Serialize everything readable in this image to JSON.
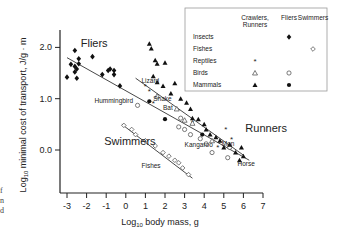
{
  "chart_data": {
    "type": "scatter",
    "title": "",
    "xlabel": "Log10 body mass, g",
    "ylabel": "Log10 minimal cost of transport, J/g·m",
    "xlim": [
      -3.4,
      7
    ],
    "ylim": [
      -0.9,
      2.35
    ],
    "x_ticks": [
      -3,
      -2,
      -1,
      0,
      1,
      2,
      3,
      4,
      5,
      6,
      7
    ],
    "y_ticks": [
      0.0,
      1.0,
      2.0
    ],
    "y_tick_labels": [
      "0.0",
      "1.0",
      "2.0"
    ],
    "grid": false,
    "legend_position": "top-right",
    "legend": {
      "columns": [
        "Crawlers, Runners",
        "Fliers",
        "Swimmers"
      ],
      "rows": [
        {
          "group": "Insects",
          "crawlers_runners": "",
          "fliers": "filled-diamond",
          "swimmers": ""
        },
        {
          "group": "Fishes",
          "crawlers_runners": "",
          "fliers": "",
          "swimmers": "open-diamond"
        },
        {
          "group": "Reptiles",
          "crawlers_runners": "asterisk",
          "fliers": "",
          "swimmers": ""
        },
        {
          "group": "Birds",
          "crawlers_runners": "open-triangle",
          "fliers": "open-circle",
          "swimmers": ""
        },
        {
          "group": "Mammals",
          "crawlers_runners": "filled-triangle",
          "fliers": "filled-circle",
          "swimmers": ""
        }
      ]
    },
    "group_labels": [
      {
        "text": "Fliers",
        "x": -2.3,
        "y": 2.0
      },
      {
        "text": "Runners",
        "x": 6.1,
        "y": 0.35
      },
      {
        "text": "Swimmers",
        "x": -1.1,
        "y": 0.1
      }
    ],
    "annotations": [
      {
        "text": "Hummingbird",
        "x": -1.6,
        "y": 0.92
      },
      {
        "text": "Lizard",
        "x": 0.8,
        "y": 1.3
      },
      {
        "text": "Snake",
        "x": 1.4,
        "y": 0.95
      },
      {
        "text": "Bat",
        "x": 1.9,
        "y": 0.78
      },
      {
        "text": "Kangaroo",
        "x": 3.0,
        "y": 0.05
      },
      {
        "text": "Man",
        "x": 4.9,
        "y": 0.08
      },
      {
        "text": "Fishes",
        "x": 0.8,
        "y": -0.35
      },
      {
        "text": "Horse",
        "x": 5.7,
        "y": -0.32
      }
    ],
    "regression_lines": [
      {
        "name": "Fliers",
        "x": [
          -3.0,
          6.3
        ],
        "y": [
          1.8,
          -0.2
        ]
      },
      {
        "name": "Runners",
        "x": [
          0.5,
          6.0
        ],
        "y": [
          1.4,
          -0.1
        ]
      },
      {
        "name": "Swimmers",
        "x": [
          -0.2,
          3.4
        ],
        "y": [
          0.5,
          -0.55
        ]
      }
    ],
    "series": [
      {
        "name": "Insects (fliers)",
        "marker": "filled-diamond",
        "x": [
          -3.0,
          -2.8,
          -2.6,
          -2.6,
          -2.5,
          -2.6,
          -2.4,
          -2.4,
          -2.5,
          -1.7,
          -1.2,
          -0.8,
          -0.9,
          -0.6,
          -0.6,
          -0.3
        ],
        "y": [
          1.42,
          1.67,
          1.94,
          1.52,
          1.58,
          1.63,
          1.68,
          1.78,
          1.4,
          1.82,
          1.47,
          1.58,
          1.55,
          1.55,
          1.47,
          1.25
        ]
      },
      {
        "name": "Birds (fliers)",
        "marker": "open-circle",
        "x": [
          0.6,
          2.7,
          3.0,
          2.8,
          3.3,
          3.8,
          4.1,
          4.4,
          5.2,
          5.3
        ],
        "y": [
          0.87,
          0.45,
          0.4,
          0.62,
          0.3,
          0.22,
          0.12,
          -0.05,
          -0.15,
          0.05
        ]
      },
      {
        "name": "Mammals (fliers)",
        "marker": "filled-circle",
        "x": [
          2.0,
          3.9,
          1.2
        ],
        "y": [
          0.6,
          0.3,
          0.95
        ]
      },
      {
        "name": "Fishes (swimmers)",
        "marker": "open-diamond",
        "x": [
          -0.1,
          0.3,
          0.5,
          1.0,
          1.5,
          1.9,
          2.2,
          2.5,
          2.7,
          2.9,
          3.2
        ],
        "y": [
          0.48,
          0.4,
          0.3,
          0.18,
          0.08,
          -0.05,
          -0.12,
          -0.2,
          -0.25,
          -0.35,
          -0.48
        ]
      },
      {
        "name": "Reptiles (crawlers/runners)",
        "marker": "asterisk",
        "x": [
          1.0,
          1.2,
          1.4,
          5.1,
          5.4,
          3.4,
          4.7
        ],
        "y": [
          1.25,
          1.15,
          0.92,
          0.4,
          0.22,
          0.55,
          0.05
        ]
      },
      {
        "name": "Birds (crawlers/runners)",
        "marker": "open-triangle",
        "x": [
          1.6,
          2.6,
          3.0,
          3.4,
          4.4
        ],
        "y": [
          1.05,
          0.8,
          0.58,
          0.52,
          0.18
        ]
      },
      {
        "name": "Mammals (crawlers/runners)",
        "marker": "filled-triangle",
        "x": [
          1.2,
          1.3,
          1.5,
          1.6,
          2.0,
          1.4,
          1.6,
          1.9,
          2.5,
          2.3,
          2.8,
          3.1,
          3.3,
          3.4,
          3.7,
          4.0,
          4.1,
          4.3,
          4.6,
          4.8,
          5.0,
          5.3,
          5.6,
          5.8,
          6.0,
          5.9
        ],
        "y": [
          2.07,
          1.98,
          1.75,
          1.68,
          1.7,
          1.44,
          1.32,
          1.25,
          1.3,
          1.1,
          1.0,
          0.92,
          0.8,
          0.62,
          0.6,
          0.5,
          0.4,
          0.3,
          0.25,
          0.18,
          0.05,
          0.1,
          -0.05,
          -0.2,
          -0.12,
          0.05
        ]
      }
    ]
  },
  "side_fragments": [
    "f",
    "n",
    "d"
  ]
}
